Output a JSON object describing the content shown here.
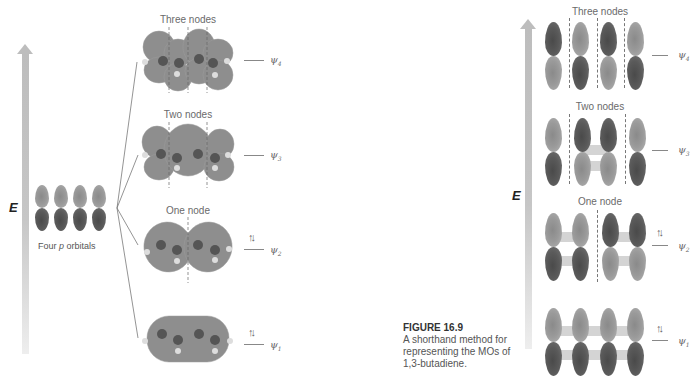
{
  "figure": {
    "number": "FIGURE 16.9",
    "caption": "A shorthand method for representing the MOs of 1,3-butadiene."
  },
  "left_panel": {
    "energy_axis_label": "E",
    "atomic_orbitals_label_prefix": "Four ",
    "atomic_orbitals_label_italic": "p",
    "atomic_orbitals_label_suffix": " orbitals",
    "mos": [
      {
        "name": "ψ",
        "sub": "4",
        "nodes_label": "Three nodes",
        "electrons": ""
      },
      {
        "name": "ψ",
        "sub": "3",
        "nodes_label": "Two nodes",
        "electrons": ""
      },
      {
        "name": "ψ",
        "sub": "2",
        "nodes_label": "One node",
        "electrons": "↑↓"
      },
      {
        "name": "ψ",
        "sub": "1",
        "nodes_label": "",
        "electrons": "↑↓"
      }
    ]
  },
  "right_panel": {
    "energy_axis_label": "E",
    "mos": [
      {
        "name": "ψ",
        "sub": "4",
        "nodes_label": "Three nodes",
        "electrons": "",
        "top_phases": [
          "dark",
          "light",
          "dark",
          "light"
        ]
      },
      {
        "name": "ψ",
        "sub": "3",
        "nodes_label": "Two nodes",
        "electrons": "",
        "top_phases": [
          "light",
          "dark",
          "dark",
          "light"
        ]
      },
      {
        "name": "ψ",
        "sub": "2",
        "nodes_label": "One node",
        "electrons": "↑↓",
        "top_phases": [
          "light",
          "light",
          "dark",
          "dark"
        ]
      },
      {
        "name": "ψ",
        "sub": "1",
        "nodes_label": "",
        "electrons": "↑↓",
        "top_phases": [
          "light",
          "light",
          "light",
          "light"
        ]
      }
    ]
  },
  "colors": {
    "arrow": "#bdbdbd",
    "dark_lobe": "#4f4f4f",
    "light_lobe": "#9a9a9a",
    "text": "#555555"
  }
}
